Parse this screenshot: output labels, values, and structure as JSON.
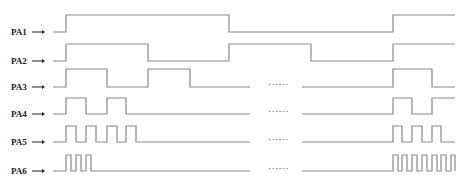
{
  "diagram": {
    "title": "",
    "colors": {
      "waveform": "#8a8a8a",
      "label": "#222222",
      "background": "#ffffff"
    },
    "ellipsis_text": "······",
    "signals": [
      {
        "name": "PA1",
        "low_y": 32,
        "high_y": 15,
        "label_y": 35,
        "points": [
          [
            53,
            "L"
          ],
          [
            66,
            "L"
          ],
          [
            66,
            "H"
          ],
          [
            229,
            "H"
          ],
          [
            229,
            "L"
          ],
          [
            393,
            "L"
          ],
          [
            393,
            "H"
          ],
          [
            455,
            "H"
          ]
        ],
        "has_gap": false
      },
      {
        "name": "PA2",
        "low_y": 61,
        "high_y": 44,
        "label_y": 64,
        "points": [
          [
            53,
            "L"
          ],
          [
            66,
            "L"
          ],
          [
            66,
            "H"
          ],
          [
            148,
            "H"
          ],
          [
            148,
            "L"
          ],
          [
            229,
            "L"
          ],
          [
            229,
            "H"
          ],
          [
            311,
            "H"
          ],
          [
            311,
            "L"
          ],
          [
            393,
            "L"
          ],
          [
            393,
            "H"
          ],
          [
            455,
            "H"
          ]
        ],
        "has_gap": false
      },
      {
        "name": "PA3",
        "low_y": 87,
        "high_y": 69,
        "label_y": 90,
        "left": [
          [
            53,
            "L"
          ],
          [
            66,
            "L"
          ],
          [
            66,
            "H"
          ],
          [
            107,
            "H"
          ],
          [
            107,
            "L"
          ],
          [
            148,
            "L"
          ],
          [
            148,
            "H"
          ],
          [
            190,
            "H"
          ],
          [
            190,
            "L"
          ],
          [
            250,
            "L"
          ]
        ],
        "right": [
          [
            302,
            "L"
          ],
          [
            393,
            "L"
          ],
          [
            393,
            "H"
          ],
          [
            432,
            "H"
          ],
          [
            432,
            "L"
          ],
          [
            455,
            "L"
          ]
        ],
        "has_gap": true
      },
      {
        "name": "PA4",
        "low_y": 114,
        "high_y": 98,
        "label_y": 117,
        "left": [
          [
            53,
            "L"
          ],
          [
            66,
            "L"
          ],
          [
            66,
            "H"
          ],
          [
            86,
            "H"
          ],
          [
            86,
            "L"
          ],
          [
            107,
            "L"
          ],
          [
            107,
            "H"
          ],
          [
            126,
            "H"
          ],
          [
            126,
            "L"
          ],
          [
            250,
            "L"
          ]
        ],
        "right": [
          [
            302,
            "L"
          ],
          [
            393,
            "L"
          ],
          [
            393,
            "H"
          ],
          [
            412,
            "H"
          ],
          [
            412,
            "L"
          ],
          [
            432,
            "L"
          ],
          [
            432,
            "H"
          ],
          [
            455,
            "H"
          ]
        ],
        "has_gap": true
      },
      {
        "name": "PA5",
        "low_y": 142,
        "high_y": 126,
        "label_y": 145,
        "left": [
          [
            53,
            "L"
          ],
          [
            66,
            "L"
          ],
          [
            66,
            "H"
          ],
          [
            76,
            "H"
          ],
          [
            76,
            "L"
          ],
          [
            86,
            "L"
          ],
          [
            86,
            "H"
          ],
          [
            96,
            "H"
          ],
          [
            96,
            "L"
          ],
          [
            107,
            "L"
          ],
          [
            107,
            "H"
          ],
          [
            117,
            "H"
          ],
          [
            117,
            "L"
          ],
          [
            126,
            "L"
          ],
          [
            126,
            "H"
          ],
          [
            136,
            "H"
          ],
          [
            136,
            "L"
          ],
          [
            250,
            "L"
          ]
        ],
        "right": [
          [
            302,
            "L"
          ],
          [
            393,
            "L"
          ],
          [
            393,
            "H"
          ],
          [
            402,
            "H"
          ],
          [
            402,
            "L"
          ],
          [
            412,
            "L"
          ],
          [
            412,
            "H"
          ],
          [
            422,
            "H"
          ],
          [
            422,
            "L"
          ],
          [
            432,
            "L"
          ],
          [
            432,
            "H"
          ],
          [
            441,
            "H"
          ],
          [
            441,
            "L"
          ],
          [
            455,
            "L"
          ]
        ],
        "has_gap": true
      },
      {
        "name": "PA6",
        "low_y": 171,
        "high_y": 155,
        "label_y": 174,
        "left": [
          [
            53,
            "L"
          ],
          [
            66,
            "L"
          ],
          [
            66,
            "H"
          ],
          [
            71,
            "H"
          ],
          [
            71,
            "L"
          ],
          [
            76,
            "L"
          ],
          [
            76,
            "H"
          ],
          [
            81,
            "H"
          ],
          [
            81,
            "L"
          ],
          [
            86,
            "L"
          ],
          [
            86,
            "H"
          ],
          [
            91,
            "H"
          ],
          [
            91,
            "L"
          ],
          [
            250,
            "L"
          ]
        ],
        "right": [
          [
            302,
            "L"
          ],
          [
            393,
            "L"
          ],
          [
            393,
            "H"
          ],
          [
            398,
            "H"
          ],
          [
            398,
            "L"
          ],
          [
            402,
            "L"
          ],
          [
            402,
            "H"
          ],
          [
            407,
            "H"
          ],
          [
            407,
            "L"
          ],
          [
            412,
            "L"
          ],
          [
            412,
            "H"
          ],
          [
            417,
            "H"
          ],
          [
            417,
            "L"
          ],
          [
            422,
            "L"
          ],
          [
            422,
            "H"
          ],
          [
            427,
            "H"
          ],
          [
            427,
            "L"
          ],
          [
            432,
            "L"
          ],
          [
            432,
            "H"
          ],
          [
            437,
            "H"
          ],
          [
            437,
            "L"
          ],
          [
            441,
            "L"
          ],
          [
            441,
            "H"
          ],
          [
            446,
            "H"
          ],
          [
            446,
            "L"
          ],
          [
            451,
            "L"
          ],
          [
            451,
            "H"
          ],
          [
            455,
            "H"
          ],
          [
            455,
            "L"
          ]
        ],
        "has_gap": true
      }
    ]
  }
}
